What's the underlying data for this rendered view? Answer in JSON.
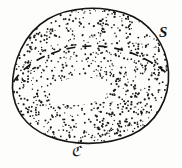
{
  "figure": {
    "kind": "mathematical-diagram",
    "background_color": "#fdfdfc",
    "ink_color": "#141414",
    "stipple_color": "#1a1a1a",
    "labels": {
      "surface": {
        "text": "S",
        "meaning": "surface-label",
        "style": "italic-serif"
      },
      "boundary": {
        "text": "ℭ",
        "meaning": "boundary-curve-label",
        "style": "fraktur-script"
      }
    },
    "outline": {
      "name": "surface-outline",
      "stroke_width": 1.6,
      "path": "M 12.5 88 C 12.0 62 24 33 48 19 C 70 6.5 100 5.5 124 13 C 150 21 167 45 168.5 72 C 170 99 156 124 131 135 C 106 146 72 146 48 136 C 26 127 13.5 110 12.5 88 Z"
    },
    "hole": {
      "name": "surface-hole",
      "path": "M 50 93 C 51 84 63 78 81 77.5 C 97 77 108 81 108.5 88 C 109 96 97 103.5 79 105 C 62 106.5 49.5 101 50 93 Z"
    },
    "dashed_curve": {
      "name": "dashed-curve",
      "stroke_width": 1.7,
      "dash_pattern": "9 7",
      "path": "M 13.5 82 C 22 68 38 57 62 50 C 86 43.5 112 45 134 54 C 150 60.5 161 68 167.5 74"
    },
    "stipple": {
      "dot_count": 1250,
      "dot_radius_min": 0.55,
      "dot_radius_max": 1.15,
      "seed": 20240531
    }
  }
}
